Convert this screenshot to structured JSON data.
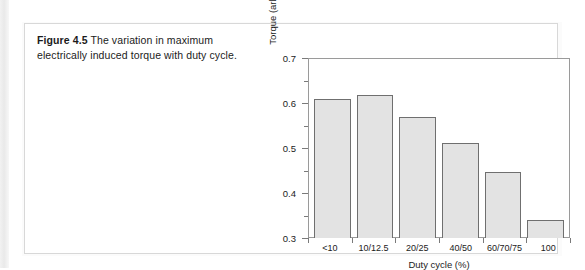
{
  "figure": {
    "caption_label": "Figure 4.5",
    "caption_text": " The variation in maximum electrically induced torque with duty cycle."
  },
  "chart_data": {
    "type": "bar",
    "title": "",
    "xlabel": "Duty cycle (%)",
    "ylabel": "Torque (arbitrary units)",
    "categories": [
      "<10",
      "10/12.5",
      "20/25",
      "40/50",
      "60/70/75",
      "100"
    ],
    "values": [
      0.608,
      0.617,
      0.568,
      0.511,
      0.447,
      0.34
    ],
    "ylim": [
      0.3,
      0.7
    ],
    "ytick_labels": [
      "0.3",
      "0.4",
      "0.5",
      "0.6",
      "0.7"
    ],
    "ytick_values": [
      0.3,
      0.4,
      0.5,
      0.6,
      0.7
    ],
    "yminor_values": [
      0.35,
      0.45,
      0.55,
      0.65
    ],
    "grid": false,
    "legend": "none",
    "bar_fill": "#e3e3e3",
    "bar_edge": "#6f6f6f",
    "axis_color": "#9a9a9a"
  }
}
